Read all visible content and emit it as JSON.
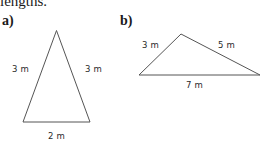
{
  "intro_text": "lengths.",
  "parts": [
    {
      "label": "a)",
      "shape": "isosceles triangle",
      "sides": {
        "left": "3 m",
        "right": "3 m",
        "base": "2 m"
      },
      "vertices": [
        [
          56.5,
          30.5
        ],
        [
          23,
          122
        ],
        [
          90,
          122
        ]
      ]
    },
    {
      "label": "b)",
      "shape": "scalene triangle",
      "sides": {
        "left": "3 m",
        "right": "5 m",
        "base": "7 m"
      },
      "vertices": [
        [
          181,
          34
        ],
        [
          139,
          75
        ],
        [
          260,
          75
        ]
      ]
    }
  ],
  "colors": {
    "line": "#555555",
    "text": "#2a2a2a"
  }
}
